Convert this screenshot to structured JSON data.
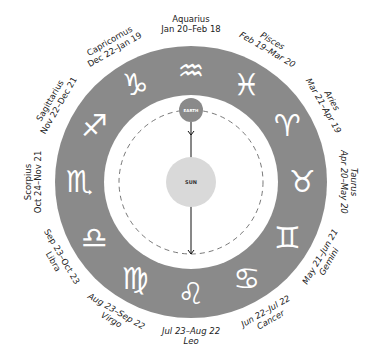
{
  "diagram": {
    "center": {
      "x": 191,
      "y": 182
    },
    "outer_radius": 136,
    "inner_radius": 87,
    "orbit_radius": 72,
    "ring_color": "#8a8a8a",
    "sun": {
      "label": "SUN",
      "color": "#d9d9d9",
      "radius": 25
    },
    "earth": {
      "label": "EARTH",
      "color": "#8a8a8a",
      "radius": 12
    },
    "signs": [
      {
        "name": "Aquarius",
        "dates": "Jan 20–Feb 18",
        "glyph": "♒",
        "angle": 0
      },
      {
        "name": "Pisces",
        "dates": "Feb 19–Mar 20",
        "glyph": "♓",
        "angle": 30
      },
      {
        "name": "Aries",
        "dates": "Mar 21–Apr 19",
        "glyph": "♈",
        "angle": 60
      },
      {
        "name": "Taurus",
        "dates": "Apr 20–May 20",
        "glyph": "♉",
        "angle": 90
      },
      {
        "name": "Gemini",
        "dates": "May 21–Jun 21",
        "glyph": "♊",
        "angle": 120
      },
      {
        "name": "Cancer",
        "dates": "Jun 22–Jul 22",
        "glyph": "♋",
        "angle": 150
      },
      {
        "name": "Leo",
        "dates": "Jul 23–Aug 22",
        "glyph": "♌",
        "angle": 180
      },
      {
        "name": "Virgo",
        "dates": "Aug 23–Sep 22",
        "glyph": "♍",
        "angle": 210
      },
      {
        "name": "Libra",
        "dates": "Sep 23–Oct 23",
        "glyph": "♎",
        "angle": 240
      },
      {
        "name": "Scorpius",
        "dates": "Oct 24–Nov 21",
        "glyph": "♏",
        "angle": 270
      },
      {
        "name": "Sagittarius",
        "dates": "Nov 22–Dec 21",
        "glyph": "♐",
        "angle": 300
      },
      {
        "name": "Capricornus",
        "dates": "Dec 22–Jan 19",
        "glyph": "♑",
        "angle": 330
      }
    ]
  }
}
